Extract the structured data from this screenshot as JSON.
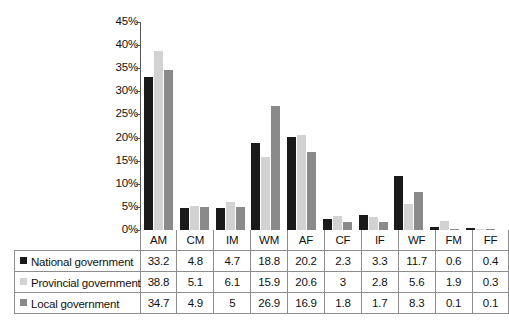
{
  "chart_data": {
    "type": "bar",
    "title": "",
    "subtitle": "",
    "xlabel": "",
    "ylabel": "",
    "ylim": [
      0,
      45
    ],
    "y_tick_labels": [
      "0%",
      "5%",
      "10%",
      "15%",
      "20%",
      "25%",
      "30%",
      "35%",
      "40%",
      "45%"
    ],
    "y_tick_values": [
      0,
      5,
      10,
      15,
      20,
      25,
      30,
      35,
      40,
      45
    ],
    "grid": false,
    "legend_position": "table-row-labels",
    "categories": [
      "AM",
      "CM",
      "IM",
      "WM",
      "AF",
      "CF",
      "IF",
      "WF",
      "FM",
      "FF"
    ],
    "series": [
      {
        "name": "National government",
        "color": "#1a1a1a",
        "values": [
          33.2,
          4.8,
          4.7,
          18.8,
          20.2,
          2.3,
          3.3,
          11.7,
          0.6,
          0.4
        ]
      },
      {
        "name": "Provincial government",
        "color": "#d2d2d2",
        "values": [
          38.8,
          5.1,
          6.1,
          15.9,
          20.6,
          3,
          2.8,
          5.6,
          1.9,
          0.3
        ]
      },
      {
        "name": "Local government",
        "color": "#8a8a8a",
        "values": [
          34.7,
          4.9,
          5,
          26.9,
          16.9,
          1.8,
          1.7,
          8.3,
          0.1,
          0.1
        ]
      }
    ],
    "value_labels": [
      [
        "33.2",
        "4.8",
        "4.7",
        "18.8",
        "20.2",
        "2.3",
        "3.3",
        "11.7",
        "0.6",
        "0.4"
      ],
      [
        "38.8",
        "5.1",
        "6.1",
        "15.9",
        "20.6",
        "3",
        "2.8",
        "5.6",
        "1.9",
        "0.3"
      ],
      [
        "34.7",
        "4.9",
        "5",
        "26.9",
        "16.9",
        "1.8",
        "1.7",
        "8.3",
        "0.1",
        "0.1"
      ]
    ]
  }
}
